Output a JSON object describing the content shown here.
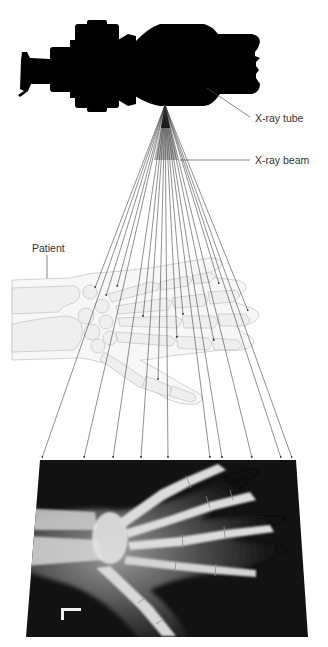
{
  "diagram": {
    "labels": {
      "tube": "X-ray tube",
      "beam": "X-ray beam",
      "patient": "Patient"
    },
    "components": [
      {
        "id": "xray-tube",
        "name": "X-ray tube",
        "shape": "black silhouette"
      },
      {
        "id": "xray-beam",
        "name": "X-ray beam",
        "shape": "fan of rays from focal point"
      },
      {
        "id": "patient-hand",
        "name": "Patient",
        "shape": "light-grey hand skeleton outline"
      },
      {
        "id": "radiograph",
        "name": "Radiograph film",
        "shape": "dark x-ray image of hand"
      }
    ],
    "beam_apex": [
      165,
      105
    ],
    "film_arrow_targets_x": [
      42,
      84,
      113,
      141,
      168,
      210,
      222,
      252,
      281,
      292
    ],
    "hand_arrow_targets": [
      [
        95,
        288
      ],
      [
        106,
        296
      ],
      [
        117,
        287
      ],
      [
        143,
        317
      ],
      [
        183,
        315
      ],
      [
        177,
        338
      ],
      [
        214,
        341
      ],
      [
        219,
        284
      ],
      [
        248,
        311
      ],
      [
        158,
        380
      ]
    ],
    "film_marker": "L",
    "colors": {
      "silhouette": "#000000",
      "bone": "#eeeeee",
      "bone_outline": "#c8c8c8",
      "ray": "#333333",
      "film_bg": "#111111",
      "film_bone": "#d9d9d9",
      "label_text": "#333333"
    }
  }
}
